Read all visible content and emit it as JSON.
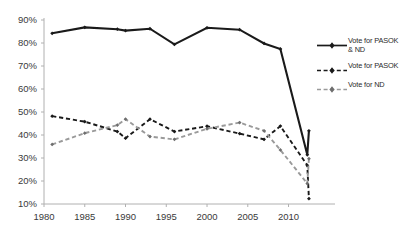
{
  "chart_data": {
    "type": "line",
    "title": "",
    "xlabel": "",
    "ylabel": "",
    "xlim": [
      1980,
      2013
    ],
    "ylim": [
      10,
      90
    ],
    "grid": false,
    "legend_position": "right",
    "xticks": [
      "1980",
      "1985",
      "1990",
      "1995",
      "2000",
      "2005",
      "2010"
    ],
    "xtick_values": [
      1980,
      1985,
      1990,
      1995,
      2000,
      2005,
      2010
    ],
    "yticks": [
      "10%",
      "20%",
      "30%",
      "40%",
      "50%",
      "60%",
      "70%",
      "80%",
      "90%"
    ],
    "ytick_values": [
      10,
      20,
      30,
      40,
      50,
      60,
      70,
      80,
      90
    ],
    "x": [
      1981,
      1985,
      1989,
      1990,
      1993,
      1996,
      2000,
      2004,
      2007,
      2009,
      2012.3,
      2012.5
    ],
    "series": [
      {
        "name": "Vote for PASOK & ND",
        "label_line1": "Vote for PASOK",
        "label_line2": "& ND",
        "style": "solid",
        "color": "#1a1a1a",
        "marker": "diamond",
        "values": [
          84.2,
          86.8,
          86.0,
          85.4,
          86.2,
          79.4,
          86.6,
          85.8,
          79.8,
          77.4,
          31.4,
          41.8
        ]
      },
      {
        "name": "Vote for PASOK",
        "label_line1": "Vote for PASOK",
        "label_line2": "",
        "style": "dashed",
        "color": "#1a1a1a",
        "marker": "diamond",
        "values": [
          48.2,
          45.8,
          41.5,
          38.6,
          46.9,
          41.5,
          43.8,
          40.6,
          38.1,
          43.9,
          26.8,
          12.3
        ]
      },
      {
        "name": "Vote for ND",
        "label_line1": "Vote for ND",
        "label_line2": "",
        "style": "dashed",
        "color": "#9a9a9a",
        "marker": "diamond",
        "values": [
          35.9,
          40.8,
          44.3,
          46.9,
          39.3,
          38.1,
          42.7,
          45.4,
          41.8,
          33.5,
          18.9,
          29.7
        ]
      }
    ]
  },
  "legend": {
    "items": [
      {
        "line1": "Vote for PASOK",
        "line2": "& ND"
      },
      {
        "line1": "Vote for PASOK",
        "line2": ""
      },
      {
        "line1": "Vote for ND",
        "line2": ""
      }
    ]
  },
  "axes": {
    "y_labels": [
      "90%",
      "80%",
      "70%",
      "60%",
      "50%",
      "40%",
      "30%",
      "20%",
      "10%"
    ],
    "x_labels": [
      "1980",
      "1985",
      "1990",
      "1995",
      "2000",
      "2005",
      "2010"
    ]
  },
  "colors": {
    "series_dark": "#1a1a1a",
    "series_gray": "#9a9a9a",
    "axis": "#b0b0b0",
    "text": "#3a3a3a"
  }
}
